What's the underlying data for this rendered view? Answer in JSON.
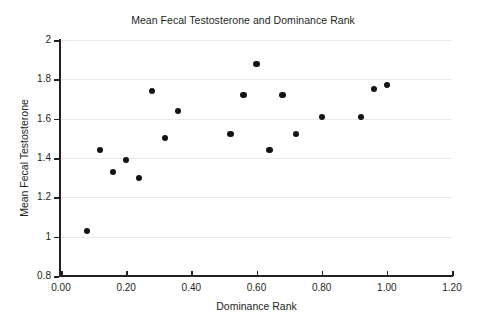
{
  "chart_data": {
    "type": "scatter",
    "title": "Mean Fecal Testosterone and Dominance Rank",
    "xlabel": "Dominance Rank",
    "ylabel": "Mean Fecal Testosterone",
    "xlim": [
      0.0,
      1.2
    ],
    "ylim": [
      0.8,
      2.0
    ],
    "xticks": [
      0.0,
      0.2,
      0.4,
      0.6,
      0.8,
      1.0,
      1.2
    ],
    "xtick_labels": [
      "0.00",
      "0.20",
      "0.40",
      "0.60",
      "0.80",
      "1.00",
      "1.20"
    ],
    "yticks": [
      0.8,
      1.0,
      1.2,
      1.4,
      1.6,
      1.8,
      2.0
    ],
    "ytick_labels": [
      "0.8",
      "1",
      "1.2",
      "1.4",
      "1.6",
      "1.8",
      "2"
    ],
    "grid": "horizontal",
    "grid_color": "#e9e9ea",
    "legend": null,
    "marker_color": "#131313",
    "marker_shape": "circle",
    "axis_color": "#231f20",
    "background_color": "#ffffff",
    "points": [
      {
        "x": 0.08,
        "y": 1.03
      },
      {
        "x": 0.12,
        "y": 1.44
      },
      {
        "x": 0.16,
        "y": 1.33
      },
      {
        "x": 0.2,
        "y": 1.39
      },
      {
        "x": 0.24,
        "y": 1.3
      },
      {
        "x": 0.28,
        "y": 1.74
      },
      {
        "x": 0.32,
        "y": 1.5
      },
      {
        "x": 0.36,
        "y": 1.64
      },
      {
        "x": 0.52,
        "y": 1.52
      },
      {
        "x": 0.56,
        "y": 1.72
      },
      {
        "x": 0.6,
        "y": 1.88
      },
      {
        "x": 0.64,
        "y": 1.44
      },
      {
        "x": 0.68,
        "y": 1.72
      },
      {
        "x": 0.72,
        "y": 1.52
      },
      {
        "x": 0.8,
        "y": 1.61
      },
      {
        "x": 0.92,
        "y": 1.61
      },
      {
        "x": 0.96,
        "y": 1.75
      },
      {
        "x": 1.0,
        "y": 1.77
      }
    ]
  }
}
